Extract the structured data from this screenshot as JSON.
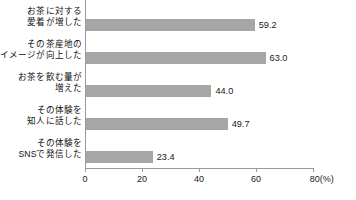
{
  "chart_data": {
    "type": "bar",
    "orientation": "horizontal",
    "title": "",
    "xlabel": "80(%)",
    "ylabel": "",
    "xlim": [
      0,
      80
    ],
    "grid": false,
    "legend": null,
    "bar_color": "#a6a6a6",
    "axis_color": "#9a9a9a",
    "categories": [
      "お茶に対する\n愛着が増した",
      "その茶産地の\nイメージが向上した",
      "お茶を飲む量が\n増えた",
      "その体験を\n知人に話した",
      "その体験を\nSNSで発信した"
    ],
    "values": [
      59.2,
      63.0,
      44.0,
      49.7,
      23.4
    ],
    "value_labels": [
      "59.2",
      "63.0",
      "44.0",
      "49.7",
      "23.4"
    ],
    "xticks": [
      0,
      20,
      40,
      60,
      80
    ],
    "xtick_labels": [
      "0",
      "20",
      "40",
      "60",
      "80(%)"
    ]
  }
}
